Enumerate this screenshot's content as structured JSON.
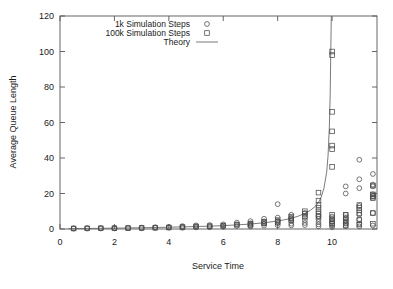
{
  "chart_data": {
    "type": "scatter",
    "title": "",
    "xlabel": "Service Time",
    "ylabel": "Average Queue Length",
    "xlim": [
      0,
      11.65
    ],
    "ylim": [
      0,
      120
    ],
    "xticks": [
      0,
      2,
      4,
      6,
      8,
      10
    ],
    "yticks": [
      0,
      20,
      40,
      60,
      80,
      100,
      120
    ],
    "xtick_labels": [
      "0",
      "2",
      "4",
      "6",
      "8",
      "10"
    ],
    "ytick_labels": [
      "0",
      "20",
      "40",
      "60",
      "80",
      "100",
      "120"
    ],
    "grid": false,
    "legend_position": "top-center",
    "legend": [
      {
        "label": "1k Simulation Steps",
        "marker": "circle"
      },
      {
        "label": "100k Simulation Steps",
        "marker": "square"
      },
      {
        "label": "Theory",
        "marker": "line"
      }
    ],
    "series": [
      {
        "name": "1k Simulation Steps",
        "marker": "circle",
        "points": [
          [
            0.5,
            0.4
          ],
          [
            0.5,
            0.2
          ],
          [
            1.0,
            0.5
          ],
          [
            1.0,
            0.3
          ],
          [
            1.5,
            0.5
          ],
          [
            1.5,
            0.3
          ],
          [
            2.0,
            0.6
          ],
          [
            2.0,
            0.3
          ],
          [
            2.5,
            0.7
          ],
          [
            2.5,
            0.4
          ],
          [
            3.0,
            0.8
          ],
          [
            3.0,
            0.4
          ],
          [
            3.5,
            1.0
          ],
          [
            3.5,
            0.6
          ],
          [
            4.0,
            1.2
          ],
          [
            4.0,
            0.7
          ],
          [
            4.5,
            1.6
          ],
          [
            4.5,
            1.1
          ],
          [
            4.5,
            0.7
          ],
          [
            5.0,
            2.0
          ],
          [
            5.0,
            1.4
          ],
          [
            5.0,
            0.9
          ],
          [
            5.5,
            2.2
          ],
          [
            5.5,
            1.5
          ],
          [
            5.5,
            1.0
          ],
          [
            6.0,
            2.6
          ],
          [
            6.0,
            1.9
          ],
          [
            6.0,
            1.2
          ],
          [
            6.5,
            3.6
          ],
          [
            6.5,
            2.6
          ],
          [
            6.5,
            1.7
          ],
          [
            7.0,
            4.4
          ],
          [
            7.0,
            3.2
          ],
          [
            7.0,
            2.1
          ],
          [
            7.0,
            1.4
          ],
          [
            7.5,
            5.8
          ],
          [
            7.5,
            4.3
          ],
          [
            7.5,
            3.0
          ],
          [
            7.5,
            1.9
          ],
          [
            8.0,
            14.0
          ],
          [
            8.0,
            6.4
          ],
          [
            8.0,
            4.6
          ],
          [
            8.0,
            3.3
          ],
          [
            8.0,
            2.1
          ],
          [
            8.5,
            8.0
          ],
          [
            8.5,
            6.2
          ],
          [
            8.5,
            4.6
          ],
          [
            8.5,
            3.0
          ],
          [
            8.5,
            2.0
          ],
          [
            9.0,
            9.0
          ],
          [
            9.0,
            6.8
          ],
          [
            9.0,
            5.0
          ],
          [
            9.0,
            3.4
          ],
          [
            9.0,
            2.2
          ],
          [
            9.5,
            7.2
          ],
          [
            9.5,
            5.6
          ],
          [
            9.5,
            4.0
          ],
          [
            9.5,
            2.6
          ],
          [
            9.5,
            1.5
          ],
          [
            10.0,
            7.0
          ],
          [
            10.0,
            5.4
          ],
          [
            10.0,
            4.2
          ],
          [
            10.0,
            3.0
          ],
          [
            10.0,
            2.0
          ],
          [
            10.0,
            1.0
          ],
          [
            10.5,
            24.0
          ],
          [
            10.5,
            20.0
          ],
          [
            10.5,
            8.0
          ],
          [
            10.5,
            6.0
          ],
          [
            10.5,
            4.4
          ],
          [
            10.5,
            3.0
          ],
          [
            10.5,
            1.6
          ],
          [
            11.0,
            39.0
          ],
          [
            11.0,
            28.0
          ],
          [
            11.0,
            23.0
          ],
          [
            11.0,
            13.0
          ],
          [
            11.0,
            8.0
          ],
          [
            11.0,
            5.5
          ],
          [
            11.0,
            3.0
          ],
          [
            11.0,
            1.5
          ],
          [
            11.5,
            31.0
          ],
          [
            11.5,
            25.0
          ],
          [
            11.5,
            24.0
          ],
          [
            11.5,
            19.5
          ],
          [
            11.5,
            18.5
          ],
          [
            11.5,
            17.5
          ],
          [
            11.5,
            9.0
          ],
          [
            11.5,
            2.0
          ]
        ]
      },
      {
        "name": "100k Simulation Steps",
        "marker": "square",
        "points": [
          [
            0.5,
            0.3
          ],
          [
            1.0,
            0.35
          ],
          [
            1.5,
            0.4
          ],
          [
            2.0,
            0.45
          ],
          [
            2.5,
            0.5
          ],
          [
            3.0,
            0.6
          ],
          [
            3.5,
            0.7
          ],
          [
            4.0,
            0.85
          ],
          [
            4.5,
            1.1
          ],
          [
            5.0,
            1.4
          ],
          [
            5.5,
            1.6
          ],
          [
            6.0,
            1.9
          ],
          [
            6.5,
            2.4
          ],
          [
            7.0,
            3.0
          ],
          [
            7.0,
            2.4
          ],
          [
            7.5,
            4.0
          ],
          [
            7.5,
            3.2
          ],
          [
            8.0,
            5.0
          ],
          [
            8.0,
            4.0
          ],
          [
            8.5,
            7.0
          ],
          [
            8.5,
            6.0
          ],
          [
            8.5,
            5.0
          ],
          [
            9.0,
            10.0
          ],
          [
            9.0,
            8.5
          ],
          [
            9.0,
            7.0
          ],
          [
            9.5,
            20.5
          ],
          [
            9.5,
            16.0
          ],
          [
            9.5,
            13.5
          ],
          [
            9.5,
            12.0
          ],
          [
            9.5,
            10.0
          ],
          [
            9.5,
            8.5
          ],
          [
            9.5,
            7.0
          ],
          [
            10.0,
            100.0
          ],
          [
            10.0,
            98.0
          ],
          [
            10.0,
            66.0
          ],
          [
            10.0,
            55.0
          ],
          [
            10.0,
            47.0
          ],
          [
            10.0,
            45.0
          ],
          [
            10.0,
            35.0
          ],
          [
            10.0,
            8.0
          ],
          [
            10.0,
            6.0
          ],
          [
            10.0,
            4.5
          ],
          [
            10.0,
            3.0
          ],
          [
            10.5,
            8.0
          ],
          [
            10.5,
            6.5
          ],
          [
            10.5,
            5.0
          ],
          [
            10.5,
            3.5
          ],
          [
            10.5,
            2.0
          ],
          [
            11.0,
            13.5
          ],
          [
            11.0,
            12.0
          ],
          [
            11.0,
            10.5
          ],
          [
            11.0,
            9.0
          ],
          [
            11.0,
            5.0
          ],
          [
            11.0,
            2.5
          ],
          [
            11.5,
            24.5
          ],
          [
            11.5,
            19.5
          ],
          [
            11.5,
            18.5
          ],
          [
            11.5,
            17.5
          ],
          [
            11.5,
            9.0
          ],
          [
            11.5,
            3.0
          ]
        ]
      },
      {
        "name": "Theory",
        "marker": "line",
        "points": [
          [
            0.3,
            0.15
          ],
          [
            1.0,
            0.3
          ],
          [
            2.0,
            0.5
          ],
          [
            3.0,
            0.7
          ],
          [
            4.0,
            1.0
          ],
          [
            5.0,
            1.4
          ],
          [
            5.5,
            1.6
          ],
          [
            6.0,
            1.9
          ],
          [
            6.5,
            2.3
          ],
          [
            7.0,
            2.8
          ],
          [
            7.5,
            3.5
          ],
          [
            8.0,
            4.5
          ],
          [
            8.25,
            5.2
          ],
          [
            8.5,
            6.0
          ],
          [
            8.75,
            7.2
          ],
          [
            9.0,
            8.8
          ],
          [
            9.2,
            10.5
          ],
          [
            9.4,
            13.0
          ],
          [
            9.5,
            15.0
          ],
          [
            9.6,
            18.0
          ],
          [
            9.7,
            23.0
          ],
          [
            9.8,
            32.0
          ],
          [
            9.85,
            41.0
          ],
          [
            9.9,
            58.0
          ],
          [
            9.93,
            76.0
          ],
          [
            9.95,
            98.0
          ],
          [
            9.97,
            120.0
          ]
        ]
      }
    ]
  }
}
